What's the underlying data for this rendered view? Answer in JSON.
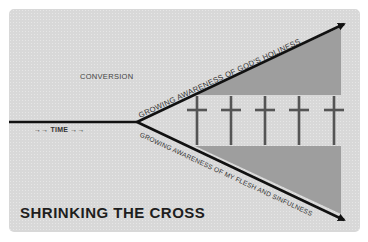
{
  "title": "SHRINKING THE CROSS",
  "labels": {
    "conversion": "CONVERSION",
    "time": "→→ TIME →→",
    "upper_arrow": "GROWING AWARENESS OF GOD'S HOLINESS",
    "lower_arrow": "GROWING AWARENESS OF MY FLESH AND SINFULNESS"
  },
  "crosses": {
    "count": 5,
    "x_positions": [
      197,
      231,
      265,
      299,
      334
    ]
  },
  "colors": {
    "background": "#d8d8d8",
    "shaded_region": "#9e9e9e",
    "lines": "#111111",
    "cross": "#555555",
    "title": "#1e1e1e"
  }
}
